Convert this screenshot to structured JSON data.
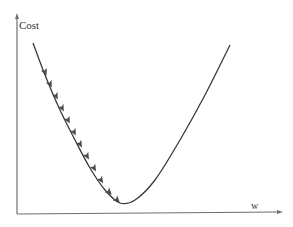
{
  "chart_data": {
    "type": "line",
    "title": "",
    "xlabel": "w",
    "ylabel": "Cost",
    "grid": false,
    "legend": null,
    "series": [
      {
        "name": "cost-curve",
        "points_px": [
          [
            33,
            43
          ],
          [
            45,
            75
          ],
          [
            60,
            110
          ],
          [
            75,
            140
          ],
          [
            90,
            168
          ],
          [
            105,
            190
          ],
          [
            120,
            203
          ],
          [
            135,
            200
          ],
          [
            155,
            180
          ],
          [
            180,
            140
          ],
          [
            205,
            95
          ],
          [
            230,
            45
          ]
        ]
      }
    ],
    "gradient_steps": {
      "count": 12,
      "arrow_positions_px": [
        [
          45,
          72
        ],
        [
          50,
          84
        ],
        [
          56,
          96
        ],
        [
          62,
          108
        ],
        [
          68,
          120
        ],
        [
          74,
          132
        ],
        [
          80,
          144
        ],
        [
          87,
          156
        ],
        [
          94,
          168
        ],
        [
          101,
          180
        ],
        [
          109,
          192
        ],
        [
          117,
          200
        ]
      ]
    },
    "minimum_px": [
      120,
      203
    ],
    "axes": {
      "origin_px": [
        17,
        214
      ],
      "x_end_px": [
        281,
        214
      ],
      "y_end_px": [
        17,
        15
      ]
    }
  },
  "colors": {
    "axis": "#6f6f6f",
    "curve": "#3a3a3a",
    "arrow": "#4a4a4a"
  }
}
